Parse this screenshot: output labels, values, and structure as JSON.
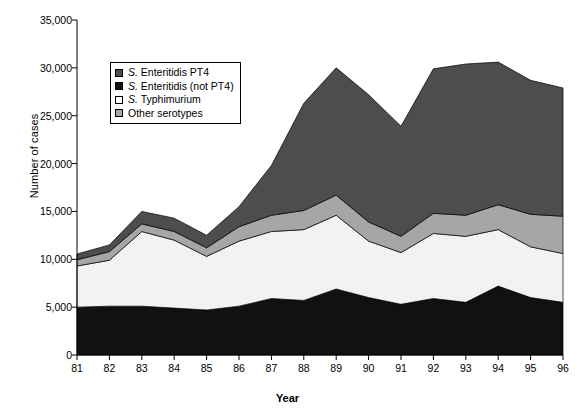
{
  "chart_data": {
    "type": "area",
    "title": "",
    "xlabel": "Year",
    "ylabel": "Number of cases",
    "categories": [
      "81",
      "82",
      "83",
      "84",
      "85",
      "86",
      "87",
      "88",
      "89",
      "90",
      "91",
      "92",
      "93",
      "94",
      "95",
      "96"
    ],
    "x": [
      81,
      82,
      83,
      84,
      85,
      86,
      87,
      88,
      89,
      90,
      91,
      92,
      93,
      94,
      95,
      96
    ],
    "xlim": [
      81,
      96
    ],
    "ylim": [
      0,
      35000
    ],
    "ytick_labels": [
      "0",
      "5,000",
      "10,000",
      "15,000",
      "20,000",
      "25,000",
      "30,000",
      "35,000"
    ],
    "ytick_values": [
      0,
      5000,
      10000,
      15000,
      20000,
      25000,
      30000,
      35000
    ],
    "grid": false,
    "legend_position": "upper-left-inside",
    "stack_order_from_bottom": [
      "S. Enteritidis (not PT4)",
      "S. Typhimurium",
      "Other serotypes",
      "S. Enteritidis PT4"
    ],
    "series": [
      {
        "name": "S. Enteritidis PT4",
        "color": "#4d4d4d",
        "legend_order": 1,
        "values": [
          600,
          700,
          1300,
          1400,
          1300,
          2100,
          5200,
          11200,
          13300,
          13300,
          11500,
          15100,
          15800,
          14900,
          14000,
          13400
        ]
      },
      {
        "name": "S. Enteritidis (not PT4)",
        "color": "#111111",
        "legend_order": 2,
        "values": [
          5000,
          5100,
          5100,
          4900,
          4700,
          5100,
          5900,
          5700,
          6900,
          6000,
          5300,
          5900,
          5500,
          7200,
          6000,
          5500
        ]
      },
      {
        "name": "S. Typhimurium",
        "color": "#f2f2f2",
        "legend_order": 3,
        "values": [
          4300,
          4800,
          7800,
          7100,
          5600,
          6800,
          7000,
          7400,
          7700,
          5900,
          5400,
          6800,
          6900,
          5900,
          5300,
          5100
        ]
      },
      {
        "name": "Other serotypes",
        "color": "#a6a6a6",
        "legend_order": 4,
        "values": [
          650,
          900,
          800,
          900,
          900,
          1500,
          1700,
          2000,
          2100,
          2000,
          1700,
          2100,
          2200,
          2600,
          3400,
          3900
        ]
      }
    ],
    "totals": [
      10550,
      11500,
      15000,
      14300,
      12500,
      15500,
      19800,
      26300,
      30000,
      27200,
      23900,
      29900,
      30400,
      30600,
      28700,
      27900
    ]
  },
  "legend": {
    "items": [
      {
        "label_prefix": "S.",
        "label_rest": " Enteritidis PT4",
        "swatch": "#4d4d4d"
      },
      {
        "label_prefix": "S.",
        "label_rest": " Enteritidis (not PT4)",
        "swatch": "#111111"
      },
      {
        "label_prefix": "S.",
        "label_rest": " Typhimurium",
        "swatch": "#ffffff"
      },
      {
        "label_prefix": "",
        "label_rest": "Other serotypes",
        "swatch": "#a6a6a6"
      }
    ]
  },
  "axes": {
    "y_title": "Number of cases",
    "x_title": "Year"
  }
}
